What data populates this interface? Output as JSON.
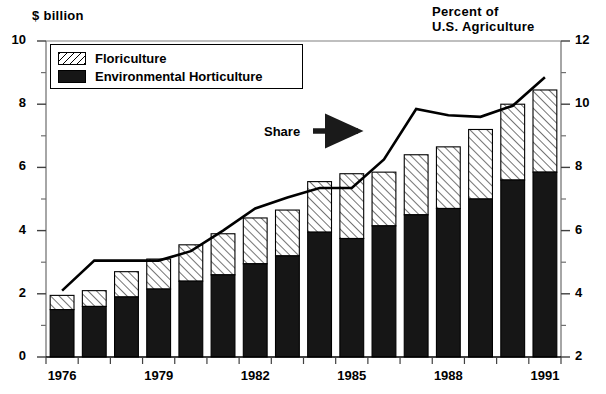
{
  "chart_data": {
    "type": "bar",
    "title": "",
    "subtitle": "",
    "xlabel": "",
    "ylabel": "$ billion",
    "y2label": "Percent of\nU.S. Agriculture",
    "ylim": [
      0,
      10
    ],
    "y2lim": [
      2,
      12
    ],
    "yticks": [
      0,
      2,
      4,
      6,
      8,
      10
    ],
    "y2ticks": [
      2,
      4,
      6,
      8,
      10,
      12
    ],
    "yminorticks": [
      1,
      3,
      5,
      7,
      9
    ],
    "y2minorticks": [
      3,
      5,
      7,
      9,
      11
    ],
    "grid": false,
    "stacked": true,
    "legend_position": "upper-left-inside",
    "categories": [
      1976,
      1977,
      1978,
      1979,
      1980,
      1981,
      1982,
      1983,
      1984,
      1985,
      1986,
      1987,
      1988,
      1989,
      1990,
      1991
    ],
    "xtick_labels": [
      "1976",
      "1979",
      "1982",
      "1985",
      "1988",
      "1991"
    ],
    "xtick_categories": [
      1976,
      1979,
      1982,
      1985,
      1988,
      1991
    ],
    "series": [
      {
        "name": "Environmental Horticulture",
        "fill": "solid-black",
        "color": "#161616",
        "axis": "left",
        "values": [
          1.5,
          1.6,
          1.9,
          2.15,
          2.4,
          2.6,
          2.95,
          3.2,
          3.95,
          3.75,
          4.15,
          4.5,
          4.7,
          5.0,
          5.6,
          5.85
        ]
      },
      {
        "name": "Floriculture",
        "fill": "diagonal-hatch",
        "color": "#ffffff",
        "axis": "left",
        "values": [
          0.45,
          0.5,
          0.8,
          0.95,
          1.15,
          1.3,
          1.45,
          1.45,
          1.6,
          2.05,
          1.7,
          1.9,
          1.95,
          2.2,
          2.4,
          2.6
        ]
      }
    ],
    "line_series": {
      "name": "Share",
      "axis": "right",
      "color": "#000000",
      "values": [
        4.1,
        5.05,
        5.05,
        5.05,
        5.35,
        6.0,
        6.7,
        7.05,
        7.35,
        7.35,
        8.25,
        9.85,
        9.65,
        9.6,
        9.95,
        10.85
      ]
    },
    "annotations": [
      {
        "name": "share-label",
        "text": "Share",
        "arrow": "right-arrow"
      }
    ],
    "legend_entries": [
      "Floriculture",
      "Environmental Horticulture"
    ]
  },
  "labels": {
    "left_axis_title": "$ billion",
    "right_axis_title_line1": "Percent of",
    "right_axis_title_line2": "U.S. Agriculture",
    "share": "Share"
  }
}
